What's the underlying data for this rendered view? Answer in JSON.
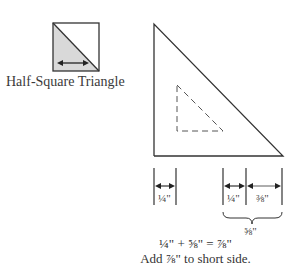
{
  "icon": {
    "caption": "Half-Square Triangle",
    "fill_color": "#d9d9d9"
  },
  "diagram": {
    "seam_allowance_left": "¼\"",
    "seam_allowance_right": "¼\"",
    "finished_part": "⅜\"",
    "total_brace": "⅝\""
  },
  "formula": {
    "line1": "¼\" + ⅝\" = ⅞\"",
    "line2": "Add ⅞\" to short side."
  }
}
